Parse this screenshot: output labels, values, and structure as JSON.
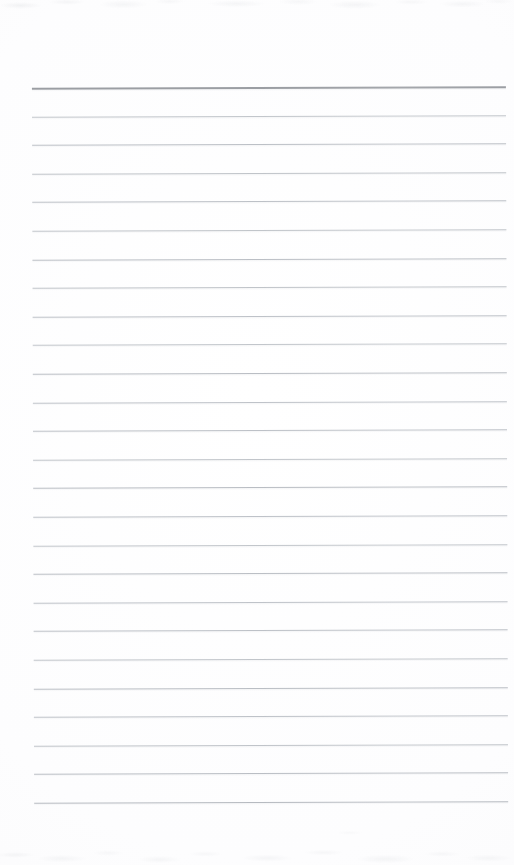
{
  "document": {
    "kind": "scanned-page",
    "subject": "blank ruled notepad paper",
    "page_width": 514,
    "page_height": 865,
    "text_content": "",
    "handwriting_present": false,
    "printed_text_present": false
  },
  "paper": {
    "background_color": "#fdfdfd",
    "edge_tone_color": "#f8f8f9",
    "noise_color": "#bfc3c8"
  },
  "ruling": {
    "line_count": 26,
    "left_x": 33,
    "right_x": 507,
    "line_width": 474,
    "first_line_y": 87,
    "line_spacing": 28.6,
    "skew_degrees": -0.18,
    "header_rule": {
      "index": 0,
      "color": "#9b9ea3",
      "thickness": 2,
      "label": "header-rule"
    },
    "body_rule": {
      "color": "#bcc0c6",
      "thickness": 1,
      "label": "body-rule"
    },
    "lines": [
      {
        "index": 0,
        "y": 87,
        "color": "#9b9ea3",
        "thickness": 2,
        "type": "header"
      },
      {
        "index": 1,
        "y": 115.6,
        "color": "#c2c6cb",
        "thickness": 1,
        "type": "body"
      },
      {
        "index": 2,
        "y": 144.2,
        "color": "#bcc0c6",
        "thickness": 1,
        "type": "body"
      },
      {
        "index": 3,
        "y": 172.8,
        "color": "#c0c4c9",
        "thickness": 1,
        "type": "body"
      },
      {
        "index": 4,
        "y": 201.4,
        "color": "#bdc1c7",
        "thickness": 1,
        "type": "body"
      },
      {
        "index": 5,
        "y": 230.0,
        "color": "#c1c5ca",
        "thickness": 1,
        "type": "body"
      },
      {
        "index": 6,
        "y": 258.6,
        "color": "#bbbfc5",
        "thickness": 1,
        "type": "body"
      },
      {
        "index": 7,
        "y": 287.2,
        "color": "#c0c4c9",
        "thickness": 1,
        "type": "body"
      },
      {
        "index": 8,
        "y": 315.8,
        "color": "#bec2c8",
        "thickness": 1,
        "type": "body"
      },
      {
        "index": 9,
        "y": 344.4,
        "color": "#c2c6cb",
        "thickness": 1,
        "type": "body"
      },
      {
        "index": 10,
        "y": 373.0,
        "color": "#babec4",
        "thickness": 1,
        "type": "body"
      },
      {
        "index": 11,
        "y": 401.6,
        "color": "#bfc3c9",
        "thickness": 1,
        "type": "body"
      },
      {
        "index": 12,
        "y": 430.2,
        "color": "#bdc1c7",
        "thickness": 1,
        "type": "body"
      },
      {
        "index": 13,
        "y": 458.8,
        "color": "#c1c5ca",
        "thickness": 1,
        "type": "body"
      },
      {
        "index": 14,
        "y": 487.4,
        "color": "#b9bdc3",
        "thickness": 1,
        "type": "body"
      },
      {
        "index": 15,
        "y": 516.0,
        "color": "#bec2c8",
        "thickness": 1,
        "type": "body"
      },
      {
        "index": 16,
        "y": 544.6,
        "color": "#c2c6cb",
        "thickness": 1,
        "type": "body"
      },
      {
        "index": 17,
        "y": 573.2,
        "color": "#bbbfc5",
        "thickness": 1,
        "type": "body"
      },
      {
        "index": 18,
        "y": 601.8,
        "color": "#bfc3c9",
        "thickness": 1,
        "type": "body"
      },
      {
        "index": 19,
        "y": 630.4,
        "color": "#bdc1c7",
        "thickness": 1,
        "type": "body"
      },
      {
        "index": 20,
        "y": 659.0,
        "color": "#c1c5ca",
        "thickness": 1,
        "type": "body"
      },
      {
        "index": 21,
        "y": 687.6,
        "color": "#babec4",
        "thickness": 1,
        "type": "body"
      },
      {
        "index": 22,
        "y": 716.2,
        "color": "#bec2c8",
        "thickness": 1,
        "type": "body"
      },
      {
        "index": 23,
        "y": 744.8,
        "color": "#c0c4c9",
        "thickness": 1,
        "type": "body"
      },
      {
        "index": 24,
        "y": 773.4,
        "color": "#babec4",
        "thickness": 1,
        "type": "body"
      },
      {
        "index": 25,
        "y": 802.0,
        "color": "#b6bac0",
        "thickness": 1,
        "type": "body"
      }
    ]
  },
  "margins": {
    "top_blank_height": 87,
    "bottom_blank_height": 63,
    "left_blank_width": 33,
    "right_blank_width": 7
  }
}
